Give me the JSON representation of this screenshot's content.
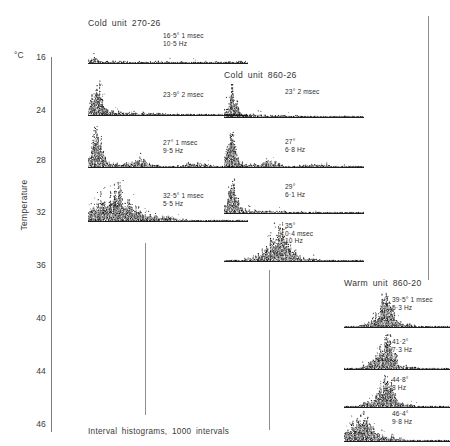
{
  "axis": {
    "unit_label": "°C",
    "title": "Temperature",
    "ticks": [
      {
        "value": "16",
        "y": 57
      },
      {
        "value": "24",
        "y": 110
      },
      {
        "value": "28",
        "y": 160
      },
      {
        "value": "32",
        "y": 212
      },
      {
        "value": "36",
        "y": 265
      },
      {
        "value": "40",
        "y": 318
      },
      {
        "value": "44",
        "y": 371
      },
      {
        "value": "46",
        "y": 424
      }
    ]
  },
  "caption": "Interval histograms, 1000 intervals",
  "rules": [
    {
      "x": 145,
      "top": 243,
      "height": 172
    },
    {
      "x": 269,
      "top": 270,
      "height": 160
    },
    {
      "x": 428,
      "top": 16,
      "height": 264
    }
  ],
  "groups": [
    {
      "name": "cold-unit-270-26",
      "title": "Cold unit 270-26",
      "title_x": 88,
      "title_y": 18,
      "traces": [
        {
          "name": "trace-16-5",
          "x": 88,
          "y": 31,
          "w": 160,
          "h": 33,
          "label_x": 163,
          "label_y": 32,
          "label_lines": [
            "16·5° 1 msec",
            "10·5 Hz"
          ],
          "shape": "flat-noisy"
        },
        {
          "name": "trace-23-9",
          "x": 88,
          "y": 76,
          "w": 160,
          "h": 40,
          "label_x": 163,
          "label_y": 91,
          "label_lines": [
            "23·9° 2 msec"
          ],
          "shape": "sharp-left-peak"
        },
        {
          "name": "trace-27",
          "x": 88,
          "y": 126,
          "w": 160,
          "h": 42,
          "label_x": 163,
          "label_y": 139,
          "label_lines": [
            "27° 1 msec",
            "9·5 Hz"
          ],
          "shape": "sharp-left-peak-bump"
        },
        {
          "name": "trace-32-5",
          "x": 88,
          "y": 180,
          "w": 160,
          "h": 42,
          "label_x": 163,
          "label_y": 192,
          "label_lines": [
            "32·5° 1 msec",
            "5·5 Hz"
          ],
          "shape": "broad-left-hump"
        }
      ]
    },
    {
      "name": "cold-unit-860-26",
      "title": "Cold unit 860-26",
      "title_x": 224,
      "title_y": 70,
      "traces": [
        {
          "name": "trace-23",
          "x": 224,
          "y": 84,
          "w": 140,
          "h": 34,
          "label_x": 285,
          "label_y": 88,
          "label_lines": [
            "23° 2 msec"
          ],
          "shape": "sharp-left-peak"
        },
        {
          "name": "trace-27b",
          "x": 224,
          "y": 130,
          "w": 140,
          "h": 38,
          "label_x": 285,
          "label_y": 138,
          "label_lines": [
            "27°",
            "6·8 Hz"
          ],
          "shape": "sharp-left-peak-bump"
        },
        {
          "name": "trace-29",
          "x": 224,
          "y": 178,
          "w": 140,
          "h": 36,
          "label_x": 285,
          "label_y": 183,
          "label_lines": [
            "29°",
            "6·1 Hz"
          ],
          "shape": "sharp-left-peak"
        },
        {
          "name": "trace-35",
          "x": 224,
          "y": 222,
          "w": 140,
          "h": 40,
          "label_x": 285,
          "label_y": 222,
          "label_lines": [
            "35°",
            "0·4 msec",
            "10 Hz"
          ],
          "shape": "centered-peak"
        }
      ]
    },
    {
      "name": "warm-unit-860-20",
      "title": "Warm unit 860-20",
      "title_x": 344,
      "title_y": 278,
      "traces": [
        {
          "name": "trace-39-5",
          "x": 344,
          "y": 292,
          "w": 106,
          "h": 36,
          "label_x": 392,
          "label_y": 296,
          "label_lines": [
            "39·5° 1 msec",
            "5·3 Hz"
          ],
          "shape": "centered-peak"
        },
        {
          "name": "trace-41-2",
          "x": 344,
          "y": 334,
          "w": 106,
          "h": 36,
          "label_x": 392,
          "label_y": 338,
          "label_lines": [
            "41·2°",
            "7·3 Hz"
          ],
          "shape": "centered-peak"
        },
        {
          "name": "trace-44-8",
          "x": 344,
          "y": 374,
          "w": 106,
          "h": 34,
          "label_x": 392,
          "label_y": 376,
          "label_lines": [
            "44·8°",
            "8 Hz"
          ],
          "shape": "centered-peak"
        },
        {
          "name": "trace-46-4",
          "x": 344,
          "y": 410,
          "w": 106,
          "h": 32,
          "label_x": 392,
          "label_y": 410,
          "label_lines": [
            "46·4°",
            "9·8 Hz"
          ],
          "shape": "broad-left-hump"
        }
      ]
    }
  ],
  "chart_data": {
    "type": "histogram-array",
    "title": "Interval histograms, 1000 intervals",
    "ylabel": "Temperature",
    "yunit": "°C",
    "ylim": [
      16,
      46
    ],
    "yticks": [
      16,
      24,
      28,
      32,
      36,
      40,
      44,
      46
    ],
    "grid": false,
    "legend": "none",
    "series": [
      {
        "name": "Cold unit 270-26",
        "records": [
          {
            "temperature_C": 16.5,
            "bin_width": "1 msec",
            "rate_Hz": 10.5,
            "label": "16·5° 1 msec / 10·5 Hz"
          },
          {
            "temperature_C": 23.9,
            "bin_width": "2 msec",
            "rate_Hz": null,
            "label": "23·9° 2 msec"
          },
          {
            "temperature_C": 27.0,
            "bin_width": "1 msec",
            "rate_Hz": 9.5,
            "label": "27° 1 msec / 9·5 Hz"
          },
          {
            "temperature_C": 32.5,
            "bin_width": "1 msec",
            "rate_Hz": 5.5,
            "label": "32·5° 1 msec / 5·5 Hz"
          }
        ]
      },
      {
        "name": "Cold unit 860-26",
        "records": [
          {
            "temperature_C": 23.0,
            "bin_width": "2 msec",
            "rate_Hz": null,
            "label": "23° 2 msec"
          },
          {
            "temperature_C": 27.0,
            "bin_width": null,
            "rate_Hz": 6.8,
            "label": "27° / 6·8 Hz"
          },
          {
            "temperature_C": 29.0,
            "bin_width": null,
            "rate_Hz": 6.1,
            "label": "29° / 6·1 Hz"
          },
          {
            "temperature_C": 35.0,
            "bin_width": "0·4 msec",
            "rate_Hz": 10.0,
            "label": "35° 0·4 msec / 10 Hz"
          }
        ]
      },
      {
        "name": "Warm unit 860-20",
        "records": [
          {
            "temperature_C": 39.5,
            "bin_width": "1 msec",
            "rate_Hz": 5.3,
            "label": "39·5° 1 msec / 5·3 Hz"
          },
          {
            "temperature_C": 41.2,
            "bin_width": null,
            "rate_Hz": 7.3,
            "label": "41·2° / 7·3 Hz"
          },
          {
            "temperature_C": 44.8,
            "bin_width": null,
            "rate_Hz": 8.0,
            "label": "44·8° / 8 Hz"
          },
          {
            "temperature_C": 46.4,
            "bin_width": null,
            "rate_Hz": 9.8,
            "label": "46·4° / 9·8 Hz"
          }
        ]
      }
    ]
  }
}
